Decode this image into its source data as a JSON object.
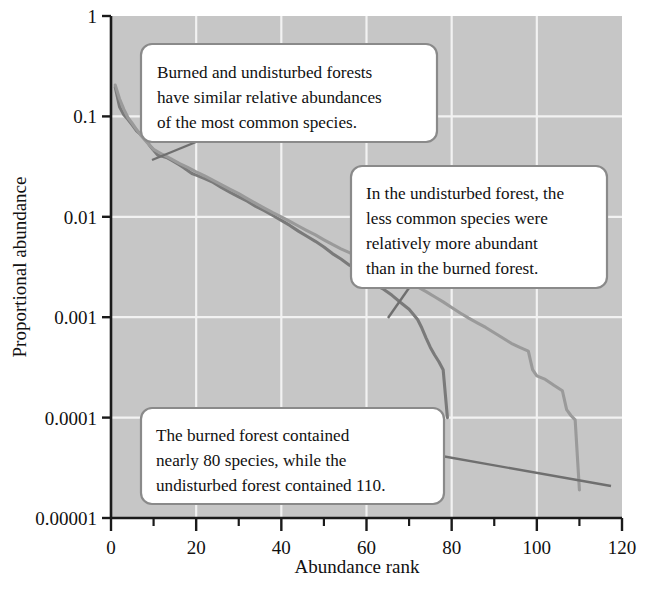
{
  "chart_data": {
    "type": "line",
    "title": "",
    "xlabel": "Abundance rank",
    "ylabel": "Proportional abundance",
    "xlim": [
      0,
      120
    ],
    "ylim": [
      1e-05,
      1
    ],
    "yscale": "log",
    "grid": true,
    "legend": "none",
    "xticks": [
      0,
      20,
      40,
      60,
      80,
      100,
      120
    ],
    "xtick_labels": [
      "0",
      "20",
      "40",
      "60",
      "80",
      "100",
      "120"
    ],
    "xminor_ticks": [
      10,
      30,
      50,
      70,
      90,
      110
    ],
    "yticks": [
      1,
      0.1,
      0.01,
      0.001,
      0.0001,
      1e-05
    ],
    "ytick_labels": [
      "1",
      "0.1",
      "0.01",
      "0.001",
      "0.0001",
      "0.00001"
    ],
    "series": [
      {
        "name": "burned forest",
        "color": "#7a7a7a",
        "n_species": 79,
        "points": [
          [
            1,
            0.195
          ],
          [
            2,
            0.125
          ],
          [
            3,
            0.104
          ],
          [
            4,
            0.093
          ],
          [
            5,
            0.082
          ],
          [
            6,
            0.072
          ],
          [
            7,
            0.066
          ],
          [
            8,
            0.06
          ],
          [
            9,
            0.052
          ],
          [
            10,
            0.046
          ],
          [
            11,
            0.041
          ],
          [
            12,
            0.04
          ],
          [
            13,
            0.039
          ],
          [
            14,
            0.037
          ],
          [
            15,
            0.035
          ],
          [
            16,
            0.033
          ],
          [
            17,
            0.031
          ],
          [
            18,
            0.029
          ],
          [
            19,
            0.027
          ],
          [
            20,
            0.026
          ],
          [
            22,
            0.024
          ],
          [
            24,
            0.022
          ],
          [
            26,
            0.0195
          ],
          [
            28,
            0.0175
          ],
          [
            30,
            0.0158
          ],
          [
            32,
            0.0143
          ],
          [
            34,
            0.0127
          ],
          [
            36,
            0.0115
          ],
          [
            38,
            0.0103
          ],
          [
            40,
            0.0092
          ],
          [
            42,
            0.0082
          ],
          [
            44,
            0.0072
          ],
          [
            46,
            0.0064
          ],
          [
            48,
            0.0057
          ],
          [
            50,
            0.005
          ],
          [
            52,
            0.0043
          ],
          [
            54,
            0.0038
          ],
          [
            56,
            0.0033
          ],
          [
            58,
            0.003
          ],
          [
            60,
            0.0027
          ],
          [
            62,
            0.0021
          ],
          [
            64,
            0.0019
          ],
          [
            66,
            0.00165
          ],
          [
            68,
            0.0014
          ],
          [
            70,
            0.0012
          ],
          [
            72,
            0.00095
          ],
          [
            73,
            0.00078
          ],
          [
            74,
            0.00062
          ],
          [
            75,
            0.0005
          ],
          [
            76,
            0.00042
          ],
          [
            77,
            0.00036
          ],
          [
            78,
            0.0003
          ],
          [
            79,
            0.0001
          ]
        ]
      },
      {
        "name": "undisturbed forest",
        "color": "#9a9a9a",
        "n_species": 110,
        "points": [
          [
            1,
            0.205
          ],
          [
            2,
            0.15
          ],
          [
            3,
            0.118
          ],
          [
            4,
            0.097
          ],
          [
            5,
            0.085
          ],
          [
            6,
            0.074
          ],
          [
            7,
            0.065
          ],
          [
            8,
            0.058
          ],
          [
            9,
            0.052
          ],
          [
            10,
            0.047
          ],
          [
            12,
            0.042
          ],
          [
            14,
            0.038
          ],
          [
            16,
            0.034
          ],
          [
            18,
            0.031
          ],
          [
            20,
            0.028
          ],
          [
            22,
            0.0255
          ],
          [
            24,
            0.023
          ],
          [
            26,
            0.0208
          ],
          [
            28,
            0.0188
          ],
          [
            30,
            0.017
          ],
          [
            32,
            0.0152
          ],
          [
            34,
            0.0136
          ],
          [
            36,
            0.0122
          ],
          [
            38,
            0.011
          ],
          [
            40,
            0.01
          ],
          [
            42,
            0.009
          ],
          [
            44,
            0.0081
          ],
          [
            46,
            0.0073
          ],
          [
            48,
            0.0066
          ],
          [
            50,
            0.0059
          ],
          [
            52,
            0.0053
          ],
          [
            54,
            0.0048
          ],
          [
            56,
            0.0044
          ],
          [
            58,
            0.004
          ],
          [
            60,
            0.0036
          ],
          [
            62,
            0.0033
          ],
          [
            64,
            0.003
          ],
          [
            66,
            0.0027
          ],
          [
            68,
            0.0024
          ],
          [
            70,
            0.0022
          ],
          [
            72,
            0.002
          ],
          [
            74,
            0.0018
          ],
          [
            76,
            0.0016
          ],
          [
            78,
            0.00142
          ],
          [
            80,
            0.00125
          ],
          [
            82,
            0.0011
          ],
          [
            84,
            0.00098
          ],
          [
            86,
            0.00088
          ],
          [
            88,
            0.00079
          ],
          [
            90,
            0.0007
          ],
          [
            92,
            0.00062
          ],
          [
            94,
            0.00055
          ],
          [
            96,
            0.0005
          ],
          [
            98,
            0.00046
          ],
          [
            99,
            0.0003
          ],
          [
            100,
            0.00026
          ],
          [
            102,
            0.00024
          ],
          [
            104,
            0.00021
          ],
          [
            106,
            0.000185
          ],
          [
            107,
            0.00012
          ],
          [
            108,
            0.000105
          ],
          [
            109,
            9.5e-05
          ],
          [
            110,
            1.9e-05
          ]
        ]
      }
    ],
    "annotations": [
      {
        "id": "callout-common-species",
        "lines": [
          "Burned and undisturbed forests",
          "have similar relative abundances",
          "of the most common species."
        ],
        "points_to": [
          14,
          0.045
        ]
      },
      {
        "id": "callout-less-common-species",
        "lines": [
          "In the undisturbed forest, the",
          "less common species were",
          "relatively more abundant",
          "than in the burned forest."
        ],
        "points_to": [
          72,
          0.0019
        ]
      },
      {
        "id": "callout-species-counts",
        "lines": [
          "The burned forest contained",
          "nearly 80 species, while the",
          "undisturbed forest contained 110."
        ],
        "points_to": [
          79,
          9e-05
        ]
      }
    ]
  },
  "style": {
    "plot_background": "#c6c6c6",
    "gridline_color": "#f2f2f2",
    "axis_color": "#1a1a1a",
    "text_color": "#111111",
    "callout_fill": "#ffffff",
    "callout_border": "#8a8a8a"
  }
}
